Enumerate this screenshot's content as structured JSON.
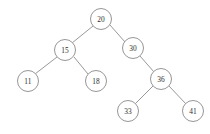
{
  "diagram": {
    "type": "binary-search-tree",
    "title": "",
    "background_color": "#ffffff",
    "node_fill": "#ffffff",
    "node_stroke": "#8a8a8a",
    "edge_color": "#8d8d8d",
    "label_color": "#2b2b2b",
    "node_radius": 10.5,
    "nodes": [
      {
        "id": "n20",
        "label": "20",
        "x": 101,
        "y": 19
      },
      {
        "id": "n15",
        "label": "15",
        "x": 65,
        "y": 50
      },
      {
        "id": "n30",
        "label": "30",
        "x": 133,
        "y": 48
      },
      {
        "id": "n11",
        "label": "11",
        "x": 28,
        "y": 81
      },
      {
        "id": "n18",
        "label": "18",
        "x": 96,
        "y": 81
      },
      {
        "id": "n36",
        "label": "36",
        "x": 161,
        "y": 79
      },
      {
        "id": "n33",
        "label": "33",
        "x": 128,
        "y": 111
      },
      {
        "id": "n41",
        "label": "41",
        "x": 193,
        "y": 111
      }
    ],
    "edges": [
      {
        "id": "e20-15",
        "from": "n20",
        "to": "n15",
        "x1": 93,
        "y1": 26,
        "x2": 72,
        "y2": 43
      },
      {
        "id": "e20-30",
        "from": "n20",
        "to": "n30",
        "x1": 110,
        "y1": 25,
        "x2": 125,
        "y2": 42
      },
      {
        "id": "e15-11",
        "from": "n15",
        "to": "n11",
        "x1": 57,
        "y1": 57,
        "x2": 35,
        "y2": 74
      },
      {
        "id": "e15-18",
        "from": "n15",
        "to": "n18",
        "x1": 74,
        "y1": 57,
        "x2": 88,
        "y2": 74
      },
      {
        "id": "e30-36",
        "from": "n30",
        "to": "n36",
        "x1": 140,
        "y1": 56,
        "x2": 154,
        "y2": 72
      },
      {
        "id": "e36-33",
        "from": "n36",
        "to": "n33",
        "x1": 153,
        "y1": 86,
        "x2": 135,
        "y2": 104
      },
      {
        "id": "e36-41",
        "from": "n36",
        "to": "n41",
        "x1": 169,
        "y1": 86,
        "x2": 186,
        "y2": 104
      }
    ]
  }
}
